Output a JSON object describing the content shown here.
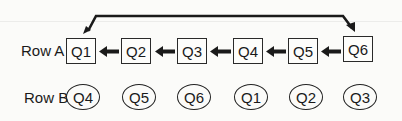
{
  "diagram": {
    "type": "queue rotation diagram",
    "row_a": {
      "label": "Row A",
      "shape": "rectangle",
      "items": [
        "Q1",
        "Q2",
        "Q3",
        "Q4",
        "Q5",
        "Q6"
      ]
    },
    "row_b": {
      "label": "Row B",
      "shape": "ellipse",
      "items": [
        "Q4",
        "Q5",
        "Q6",
        "Q1",
        "Q2",
        "Q3"
      ]
    },
    "arrows": [
      {
        "from": "Q2",
        "to": "Q1",
        "direction": "left"
      },
      {
        "from": "Q3",
        "to": "Q2",
        "direction": "left"
      },
      {
        "from": "Q4",
        "to": "Q3",
        "direction": "left"
      },
      {
        "from": "Q5",
        "to": "Q4",
        "direction": "left"
      },
      {
        "from": "Q6",
        "to": "Q5",
        "direction": "left"
      },
      {
        "from": "Q1",
        "to": "Q6",
        "direction": "wrap-around over top"
      }
    ],
    "colors": {
      "stroke": "#1a1a1a",
      "background": "#fbfbf9"
    }
  }
}
